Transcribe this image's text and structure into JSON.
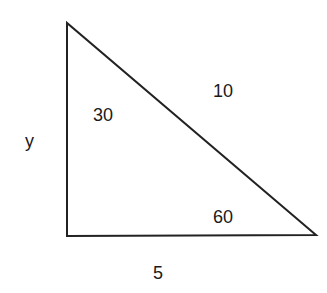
{
  "diagram": {
    "type": "right-triangle",
    "stroke_color": "#222222",
    "vertices": {
      "top": [
        67,
        23
      ],
      "bottom_left": [
        67,
        236
      ],
      "bottom_right": [
        316,
        235
      ]
    },
    "labels": {
      "vertical_side": "y",
      "horizontal_side": "5",
      "hypotenuse": "10",
      "top_angle": "30",
      "right_angle_at_bottom_right": "60"
    }
  }
}
